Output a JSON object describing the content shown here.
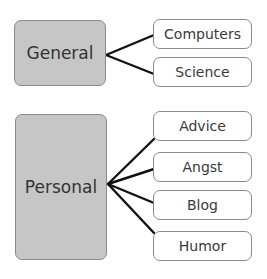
{
  "groups": [
    {
      "label": "General",
      "children": [
        "Computers",
        "Science"
      ]
    },
    {
      "label": "Personal",
      "children": [
        "Advice",
        "Angst",
        "Blog",
        "Humor"
      ]
    }
  ],
  "colors": {
    "parent_fill": "#c6c6c6",
    "border": "#8a8a8a",
    "connector": "#111111",
    "child_fill": "#ffffff"
  }
}
